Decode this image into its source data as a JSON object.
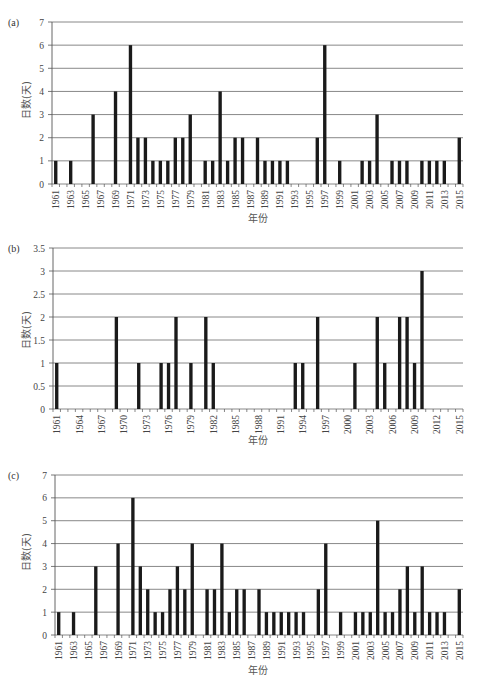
{
  "chart_data": [
    {
      "type": "bar",
      "panel": "(a)",
      "xlabel": "年份",
      "ylabel": "日数(天)",
      "ylim": [
        0,
        7
      ],
      "yticks": [
        0,
        1,
        2,
        3,
        4,
        5,
        6,
        7
      ],
      "xrange": [
        1961,
        2015
      ],
      "xtick_labels": [
        "1961",
        "1963",
        "1965",
        "1967",
        "1969",
        "1971",
        "1973",
        "1975",
        "1977",
        "1979",
        "1981",
        "1983",
        "1985",
        "1987",
        "1989",
        "1991",
        "1993",
        "1995",
        "1997",
        "1999",
        "2001",
        "2003",
        "2005",
        "2007",
        "2009",
        "2011",
        "2013",
        "2015"
      ],
      "grid": true,
      "bars": [
        {
          "year": 1961,
          "value": 1
        },
        {
          "year": 1963,
          "value": 1
        },
        {
          "year": 1966,
          "value": 3
        },
        {
          "year": 1969,
          "value": 4
        },
        {
          "year": 1971,
          "value": 6
        },
        {
          "year": 1972,
          "value": 2
        },
        {
          "year": 1973,
          "value": 2
        },
        {
          "year": 1974,
          "value": 1
        },
        {
          "year": 1975,
          "value": 1
        },
        {
          "year": 1976,
          "value": 1
        },
        {
          "year": 1977,
          "value": 2
        },
        {
          "year": 1978,
          "value": 2
        },
        {
          "year": 1979,
          "value": 3
        },
        {
          "year": 1981,
          "value": 1
        },
        {
          "year": 1982,
          "value": 1
        },
        {
          "year": 1983,
          "value": 4
        },
        {
          "year": 1984,
          "value": 1
        },
        {
          "year": 1985,
          "value": 2
        },
        {
          "year": 1986,
          "value": 2
        },
        {
          "year": 1988,
          "value": 2
        },
        {
          "year": 1989,
          "value": 1
        },
        {
          "year": 1990,
          "value": 1
        },
        {
          "year": 1991,
          "value": 1
        },
        {
          "year": 1992,
          "value": 1
        },
        {
          "year": 1996,
          "value": 2
        },
        {
          "year": 1997,
          "value": 6
        },
        {
          "year": 1999,
          "value": 1
        },
        {
          "year": 2002,
          "value": 1
        },
        {
          "year": 2003,
          "value": 1
        },
        {
          "year": 2004,
          "value": 3
        },
        {
          "year": 2006,
          "value": 1
        },
        {
          "year": 2007,
          "value": 1
        },
        {
          "year": 2008,
          "value": 1
        },
        {
          "year": 2010,
          "value": 1
        },
        {
          "year": 2011,
          "value": 1
        },
        {
          "year": 2012,
          "value": 1
        },
        {
          "year": 2013,
          "value": 1
        },
        {
          "year": 2015,
          "value": 2
        }
      ]
    },
    {
      "type": "bar",
      "panel": "(b)",
      "xlabel": "年份",
      "ylabel": "日数(天)",
      "ylim": [
        0,
        3.5
      ],
      "yticks": [
        0,
        0.5,
        1,
        1.5,
        2,
        2.5,
        3,
        3.5
      ],
      "xrange": [
        1961,
        2015
      ],
      "xtick_labels": [
        "1961",
        "1964",
        "1967",
        "1970",
        "1973",
        "1976",
        "1979",
        "1982",
        "1985",
        "1988",
        "1991",
        "1994",
        "1997",
        "2000",
        "2003",
        "2006",
        "2009",
        "2012",
        "2015"
      ],
      "grid": true,
      "bars": [
        {
          "year": 1961,
          "value": 1
        },
        {
          "year": 1969,
          "value": 2
        },
        {
          "year": 1972,
          "value": 1
        },
        {
          "year": 1975,
          "value": 1
        },
        {
          "year": 1976,
          "value": 1
        },
        {
          "year": 1977,
          "value": 2
        },
        {
          "year": 1979,
          "value": 1
        },
        {
          "year": 1981,
          "value": 2
        },
        {
          "year": 1982,
          "value": 1
        },
        {
          "year": 1993,
          "value": 1
        },
        {
          "year": 1994,
          "value": 1
        },
        {
          "year": 1996,
          "value": 2
        },
        {
          "year": 2001,
          "value": 1
        },
        {
          "year": 2004,
          "value": 2
        },
        {
          "year": 2005,
          "value": 1
        },
        {
          "year": 2007,
          "value": 2
        },
        {
          "year": 2008,
          "value": 2
        },
        {
          "year": 2009,
          "value": 1
        },
        {
          "year": 2010,
          "value": 3
        }
      ]
    },
    {
      "type": "bar",
      "panel": "(c)",
      "xlabel": "年份",
      "ylabel": "日数(天)",
      "ylim": [
        0,
        7
      ],
      "yticks": [
        0,
        1,
        2,
        3,
        4,
        5,
        6,
        7
      ],
      "xrange": [
        1961,
        2015
      ],
      "xtick_labels": [
        "1961",
        "1963",
        "1965",
        "1967",
        "1969",
        "1971",
        "1973",
        "1975",
        "1977",
        "1979",
        "1981",
        "1983",
        "1985",
        "1987",
        "1989",
        "1991",
        "1993",
        "1995",
        "1997",
        "1999",
        "2001",
        "2003",
        "2005",
        "2007",
        "2009",
        "2011",
        "2013",
        "2015"
      ],
      "grid": true,
      "bars": [
        {
          "year": 1961,
          "value": 1
        },
        {
          "year": 1963,
          "value": 1
        },
        {
          "year": 1966,
          "value": 3
        },
        {
          "year": 1969,
          "value": 4
        },
        {
          "year": 1971,
          "value": 6
        },
        {
          "year": 1972,
          "value": 3
        },
        {
          "year": 1973,
          "value": 2
        },
        {
          "year": 1974,
          "value": 1
        },
        {
          "year": 1975,
          "value": 1
        },
        {
          "year": 1976,
          "value": 2
        },
        {
          "year": 1977,
          "value": 3
        },
        {
          "year": 1978,
          "value": 2
        },
        {
          "year": 1979,
          "value": 4
        },
        {
          "year": 1981,
          "value": 2
        },
        {
          "year": 1982,
          "value": 2
        },
        {
          "year": 1983,
          "value": 4
        },
        {
          "year": 1984,
          "value": 1
        },
        {
          "year": 1985,
          "value": 2
        },
        {
          "year": 1986,
          "value": 2
        },
        {
          "year": 1988,
          "value": 2
        },
        {
          "year": 1989,
          "value": 1
        },
        {
          "year": 1990,
          "value": 1
        },
        {
          "year": 1991,
          "value": 1
        },
        {
          "year": 1992,
          "value": 1
        },
        {
          "year": 1993,
          "value": 1
        },
        {
          "year": 1994,
          "value": 1
        },
        {
          "year": 1996,
          "value": 2
        },
        {
          "year": 1997,
          "value": 4
        },
        {
          "year": 1999,
          "value": 1
        },
        {
          "year": 2001,
          "value": 1
        },
        {
          "year": 2002,
          "value": 1
        },
        {
          "year": 2003,
          "value": 1
        },
        {
          "year": 2004,
          "value": 5
        },
        {
          "year": 2005,
          "value": 1
        },
        {
          "year": 2006,
          "value": 1
        },
        {
          "year": 2007,
          "value": 2
        },
        {
          "year": 2008,
          "value": 3
        },
        {
          "year": 2009,
          "value": 1
        },
        {
          "year": 2010,
          "value": 3
        },
        {
          "year": 2011,
          "value": 1
        },
        {
          "year": 2012,
          "value": 1
        },
        {
          "year": 2013,
          "value": 1
        },
        {
          "year": 2015,
          "value": 2
        }
      ]
    }
  ],
  "style": {
    "bar_color": "#1a1a1a",
    "grid_color": "#7a7a7a",
    "axis_color": "#555555"
  }
}
